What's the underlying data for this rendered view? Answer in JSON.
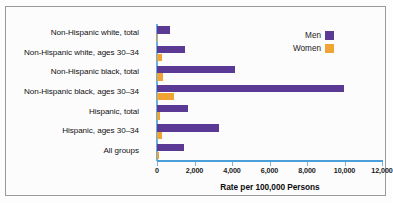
{
  "chart_data": {
    "type": "bar",
    "orientation": "horizontal",
    "title": "",
    "xlabel": "Rate per 100,000 Persons",
    "ylabel": "",
    "xlim": [
      0,
      12000
    ],
    "xticks": [
      0,
      2000,
      4000,
      6000,
      8000,
      10000,
      12000
    ],
    "xtick_labels": [
      "0",
      "2,000",
      "4,000",
      "6,000",
      "8,000",
      "10,000",
      "12,000"
    ],
    "grid": false,
    "legend_position": "top-right",
    "categories": [
      "Non-Hispanic white, total",
      "Non-Hispanic white, ages 30–34",
      "Non-Hispanic black, total",
      "Non-Hispanic black, ages 30–34",
      "Hispanic, total",
      "Hispanic, ages 30–34",
      "All groups"
    ],
    "series": [
      {
        "name": "Men",
        "color": "#5b3a96",
        "values": [
          700,
          1500,
          4150,
          9970,
          1650,
          3300,
          1450
        ]
      },
      {
        "name": "Women",
        "color": "#efa433",
        "values": [
          70,
          240,
          320,
          880,
          150,
          290,
          130
        ]
      }
    ]
  },
  "legend": {
    "entries": [
      {
        "label": "Men",
        "color": "#5b3a96"
      },
      {
        "label": "Women",
        "color": "#efa433"
      }
    ]
  },
  "colors": {
    "men": "#5b3a96",
    "women": "#efa433",
    "axis": "#4a9fd8",
    "border": "#9a9a9a"
  }
}
